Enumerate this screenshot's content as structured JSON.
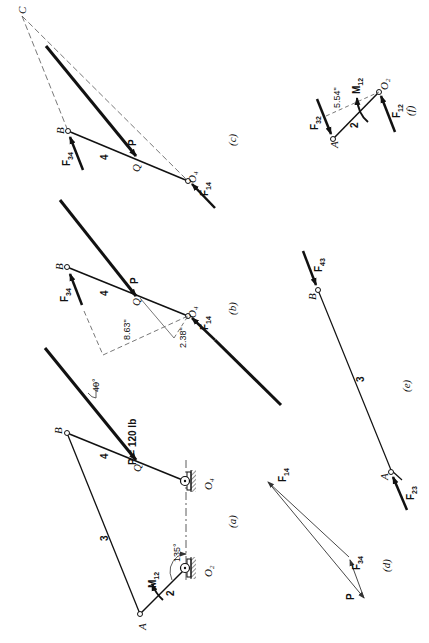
{
  "figure": {
    "orientation": "rotated 90° (landscape figure printed in portrait)",
    "panels": {
      "a": {
        "caption": "(a)",
        "links": [
          {
            "id": "2",
            "label": "2"
          },
          {
            "id": "3",
            "label": "3"
          },
          {
            "id": "4",
            "label": "4"
          }
        ],
        "points": {
          "A": "A",
          "B": "B",
          "Q": "Q",
          "O2": "O",
          "O2_sub": "2",
          "O4": "O",
          "O4_sub": "4"
        },
        "moment": {
          "label": "M",
          "sub": "12"
        },
        "load": {
          "label": "P = 120 lb",
          "angle": "40°"
        },
        "crank_angle": "135°"
      },
      "b": {
        "caption": "(b)",
        "link_label": "4",
        "points": {
          "B": "B",
          "Q": "Q",
          "O4": "O",
          "O4_sub": "4"
        },
        "forces": {
          "F34": {
            "label": "F",
            "sub": "34"
          },
          "F14": {
            "label": "F",
            "sub": "14"
          },
          "P": "P"
        },
        "dimensions": [
          "8.63\"",
          "2.38\""
        ]
      },
      "c": {
        "caption": "(c)",
        "link_label": "4",
        "points": {
          "B": "B",
          "Q": "Q",
          "O4": "O",
          "O4_sub": "4",
          "C": "C"
        },
        "forces": {
          "F34": {
            "label": "F",
            "sub": "34"
          },
          "F14": {
            "label": "F",
            "sub": "14"
          },
          "P": "P"
        }
      },
      "d": {
        "caption": "(d)",
        "forces": {
          "F14": {
            "label": "F",
            "sub": "14"
          },
          "F34": {
            "label": "F",
            "sub": "34"
          },
          "P": "P"
        }
      },
      "e": {
        "caption": "(e)",
        "link_label": "3",
        "points": {
          "A": "A",
          "B": "B"
        },
        "forces": {
          "F43": {
            "label": "F",
            "sub": "43"
          },
          "F23": {
            "label": "F",
            "sub": "23"
          }
        }
      },
      "f": {
        "caption": "(f)",
        "link_label": "2",
        "points": {
          "A": "A",
          "O2": "O",
          "O2_sub": "2"
        },
        "forces": {
          "F32": {
            "label": "F",
            "sub": "32"
          },
          "F12": {
            "label": "F",
            "sub": "12"
          }
        },
        "moment": {
          "label": "M",
          "sub": "12"
        },
        "dimension": "5.54\""
      }
    }
  }
}
